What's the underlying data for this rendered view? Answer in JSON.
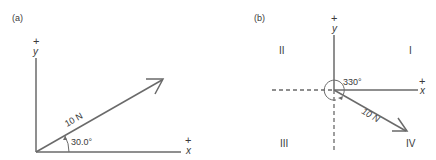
{
  "panels": [
    {
      "label": "(a)",
      "y_axis": {
        "sign": "+",
        "name": "y"
      },
      "x_axis": {
        "sign": "+",
        "name": "x"
      },
      "vector": {
        "magnitude_label": "10 N",
        "angle_label": "30.0°"
      }
    },
    {
      "label": "(b)",
      "y_axis": {
        "sign": "+",
        "name": "y"
      },
      "x_axis": {
        "sign": "+",
        "name": "x"
      },
      "quadrants": {
        "q1": "I",
        "q2": "II",
        "q3": "III",
        "q4": "IV"
      },
      "vector": {
        "magnitude_label": "10 N",
        "angle_label": "330°"
      }
    }
  ],
  "colors": {
    "line": "#6a6a6a",
    "text": "#3a3a3a"
  }
}
